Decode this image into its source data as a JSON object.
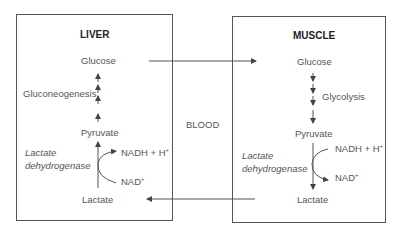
{
  "liver": {
    "title": "LIVER",
    "glucose": "Glucose",
    "process": "Gluconeogenesis",
    "pyruvate": "Pyruvate",
    "enzyme_line1": "Lactate",
    "enzyme_line2": "dehydrogenase",
    "nadh": "NADH + H",
    "nadh_sup": "+",
    "nad": "NAD",
    "nad_sup": "+",
    "lactate": "Lactate"
  },
  "muscle": {
    "title": "MUSCLE",
    "glucose": "Glucose",
    "process": "Glycolysis",
    "pyruvate": "Pyruvate",
    "enzyme_line1": "Lactate",
    "enzyme_line2": "dehydrogenase",
    "nadh": "NADH + H",
    "nadh_sup": "+",
    "nad": "NAD",
    "nad_sup": "+",
    "lactate": "Lactate"
  },
  "blood": {
    "label": "BLOOD"
  },
  "colors": {
    "line": "#555555",
    "title": "#222222",
    "text": "#555555"
  }
}
